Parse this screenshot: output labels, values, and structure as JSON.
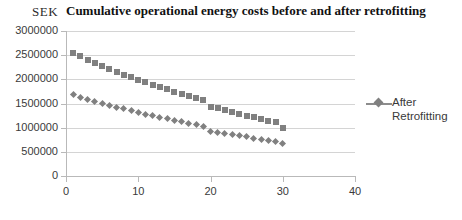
{
  "chart_data": {
    "type": "scatter",
    "title": "Cumulative operational energy costs before and after retrofitting",
    "unit_label": "SEK",
    "xlabel": "",
    "ylabel": "",
    "xlim": [
      0,
      40
    ],
    "ylim": [
      0,
      3000000
    ],
    "grid": true,
    "legend_position": "right",
    "marker_color": "#808080",
    "gridline_color": "#d4d4d4",
    "axis_color": "#b9b9b9",
    "y_ticks": [
      0,
      500000,
      1000000,
      1500000,
      2000000,
      2500000,
      3000000
    ],
    "y_tick_labels": [
      "0",
      "500000",
      "1000000",
      "1500000",
      "2000000",
      "2500000",
      "3000000"
    ],
    "x_ticks": [
      0,
      10,
      20,
      30,
      40
    ],
    "x_tick_labels": [
      "0",
      "10",
      "20",
      "30",
      "40"
    ],
    "x": [
      1,
      2,
      3,
      4,
      5,
      6,
      7,
      8,
      9,
      10,
      11,
      12,
      13,
      14,
      15,
      16,
      17,
      18,
      19,
      20,
      21,
      22,
      23,
      24,
      25,
      26,
      27,
      28,
      29,
      30
    ],
    "series": [
      {
        "name": "Before Retrofitting",
        "marker": "square",
        "color": "#808080",
        "in_legend": false,
        "values": [
          2550000,
          2480000,
          2410000,
          2345000,
          2280000,
          2220000,
          2160000,
          2100000,
          2045000,
          1990000,
          1935000,
          1885000,
          1835000,
          1790000,
          1740000,
          1695000,
          1650000,
          1605000,
          1565000,
          1430000,
          1400000,
          1360000,
          1325000,
          1285000,
          1250000,
          1215000,
          1180000,
          1145000,
          1110000,
          1000000
        ]
      },
      {
        "name": "After Retrofitting",
        "marker": "diamond",
        "color": "#808080",
        "in_legend": true,
        "legend_label": "After\nRetrofitting",
        "values": [
          1680000,
          1630000,
          1585000,
          1545000,
          1505000,
          1465000,
          1425000,
          1390000,
          1350000,
          1315000,
          1280000,
          1245000,
          1215000,
          1180000,
          1150000,
          1120000,
          1090000,
          1060000,
          1030000,
          930000,
          905000,
          880000,
          855000,
          830000,
          810000,
          785000,
          760000,
          740000,
          715000,
          670000
        ]
      }
    ]
  }
}
